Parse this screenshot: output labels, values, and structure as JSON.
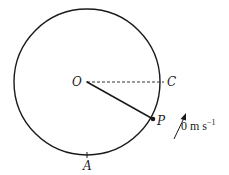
{
  "diagram": {
    "type": "circular-motion",
    "circle": {
      "cx": 87,
      "cy": 82,
      "r": 73,
      "stroke": "#1a1a1a"
    },
    "points": {
      "O": {
        "label": "O",
        "x": 87,
        "y": 82
      },
      "C": {
        "label": "C",
        "x": 164,
        "y": 82
      },
      "P": {
        "label": "P",
        "x": 153,
        "y": 119
      },
      "A": {
        "label": "A",
        "x": 87,
        "y": 155
      }
    },
    "lines": [
      {
        "name": "radius-OC",
        "from": "O",
        "to": "C",
        "style": "dashed"
      },
      {
        "name": "radius-OP",
        "from": "O",
        "to": "P",
        "style": "solid"
      }
    ],
    "velocity_arrow": {
      "label_value": "0",
      "label_unit": "m s",
      "label_exponent": "−1"
    }
  }
}
